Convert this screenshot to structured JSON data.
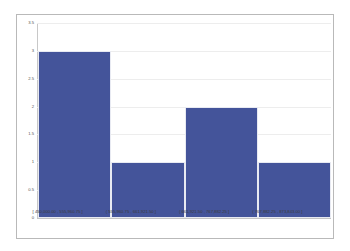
{
  "chart_data": {
    "type": "bar",
    "title": "",
    "subtitle": "",
    "xlabel": "",
    "ylabel": "",
    "categories": [
      "[ 450,000.00 , 555,960.75 ]",
      "( 555,960.75 , 661,921.50 ]",
      "( 661,921.50 , 767,882.25 ]",
      "( 767,882.25 , 873,843.00 ]"
    ],
    "values": [
      3,
      1,
      2,
      1
    ],
    "ylim": [
      0,
      3.5
    ],
    "ytick_labels": [
      "3.5",
      "3",
      "2.5",
      "2",
      "1.5",
      "1",
      "0.5",
      "0"
    ],
    "ytick_values": [
      3.5,
      3,
      2.5,
      2,
      1.5,
      1,
      0.5,
      0
    ],
    "grid": true,
    "legend": false,
    "legend_position": "none",
    "bar_color": "#44554A"
  },
  "style": {
    "bar_fill": "#44549A",
    "bar_edge": "#e8eaf2",
    "grid_color": "#ededed",
    "axis_color": "#c8c8c8",
    "frame_color": "#b9b9b9",
    "plot_background": "#ffffff",
    "tick_text_color": "#555555",
    "category_text_color": "#3b3b3b"
  }
}
